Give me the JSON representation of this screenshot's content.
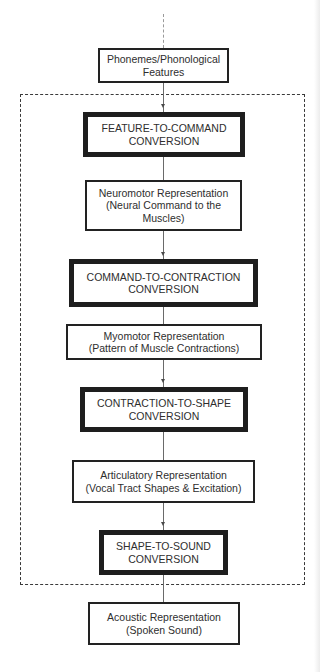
{
  "diagram": {
    "nodes": [
      {
        "id": "phonemes",
        "kind": "representation",
        "lines": [
          "Phonemes/Phonological",
          "Features"
        ]
      },
      {
        "id": "feature-to-command",
        "kind": "conversion",
        "lines": [
          "FEATURE-TO-COMMAND",
          "CONVERSION"
        ]
      },
      {
        "id": "neuromotor",
        "kind": "representation",
        "lines": [
          "Neuromotor Representation",
          "(Neural Command to the",
          "Muscles)"
        ]
      },
      {
        "id": "command-to-contraction",
        "kind": "conversion",
        "lines": [
          "COMMAND-TO-CONTRACTION",
          "CONVERSION"
        ]
      },
      {
        "id": "myomotor",
        "kind": "representation",
        "lines": [
          "Myomotor Representation",
          "(Pattern of Muscle Contractions)"
        ]
      },
      {
        "id": "contraction-to-shape",
        "kind": "conversion",
        "lines": [
          "CONTRACTION-TO-SHAPE",
          "CONVERSION"
        ]
      },
      {
        "id": "articulatory",
        "kind": "representation",
        "lines": [
          "Articulatory Representation",
          "(Vocal Tract Shapes & Excitation)"
        ]
      },
      {
        "id": "shape-to-sound",
        "kind": "conversion",
        "lines": [
          "SHAPE-TO-SOUND",
          "CONVERSION"
        ]
      },
      {
        "id": "acoustic",
        "kind": "representation",
        "lines": [
          "Acoustic Representation",
          "(Spoken Sound)"
        ]
      }
    ],
    "edges": [
      [
        "phonemes",
        "feature-to-command"
      ],
      [
        "feature-to-command",
        "neuromotor"
      ],
      [
        "neuromotor",
        "command-to-contraction"
      ],
      [
        "command-to-contraction",
        "myomotor"
      ],
      [
        "myomotor",
        "contraction-to-shape"
      ],
      [
        "contraction-to-shape",
        "articulatory"
      ],
      [
        "articulatory",
        "shape-to-sound"
      ],
      [
        "shape-to-sound",
        "acoustic"
      ]
    ],
    "group": {
      "style": "dashed",
      "contains": [
        "feature-to-command",
        "neuromotor",
        "command-to-contraction",
        "myomotor",
        "contraction-to-shape",
        "articulatory",
        "shape-to-sound"
      ]
    }
  }
}
